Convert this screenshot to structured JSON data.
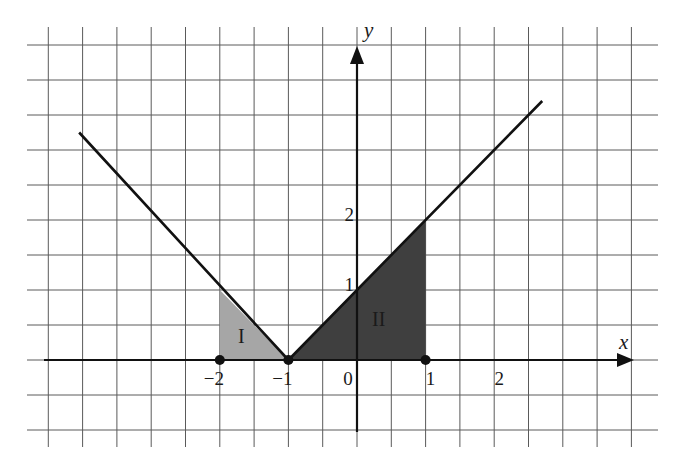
{
  "figure": {
    "type": "coordinate-grid",
    "grid_step_units": 0.5,
    "x_axis": {
      "label": "x",
      "ticks": [
        {
          "value": -2,
          "label": "−2"
        },
        {
          "value": -1,
          "label": "−1"
        },
        {
          "value": 0,
          "label": "0"
        },
        {
          "value": 1,
          "label": "1"
        },
        {
          "value": 2,
          "label": "2"
        }
      ]
    },
    "y_axis": {
      "label": "y",
      "ticks": [
        {
          "value": 1,
          "label": "1"
        },
        {
          "value": 2,
          "label": "2"
        }
      ]
    },
    "curve": {
      "equation": "y = |x + 1|",
      "vertex": [
        -1,
        0
      ],
      "left_end": [
        -4.05,
        3.25
      ],
      "right_end": [
        2.7,
        3.7
      ]
    },
    "regions": [
      {
        "id": "I",
        "label": "I",
        "vertices": [
          [
            -2,
            0
          ],
          [
            -2,
            1
          ],
          [
            -1,
            0
          ]
        ],
        "fill": "#a6a6a6"
      },
      {
        "id": "II",
        "label": "II",
        "vertices": [
          [
            -1,
            0
          ],
          [
            1,
            2
          ],
          [
            1,
            0
          ]
        ],
        "fill": "#3f3f3f"
      }
    ],
    "marked_points": [
      {
        "x": -2,
        "y": 0
      },
      {
        "x": -1,
        "y": 0
      },
      {
        "x": 1,
        "y": 0
      }
    ],
    "colors": {
      "grid": "#555555",
      "axis": "#111111",
      "curve": "#111111",
      "region_I": "#a6a6a6",
      "region_II": "#3f3f3f"
    }
  }
}
